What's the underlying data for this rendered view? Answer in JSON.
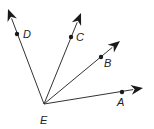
{
  "diagram": {
    "type": "rays-from-common-endpoint",
    "vertex": {
      "label": "E",
      "x": 44,
      "y": 104,
      "label_x": 40,
      "label_y": 124
    },
    "rays": [
      {
        "name": "ray-ED",
        "point_label": "D",
        "tip": [
          8,
          9
        ],
        "point": [
          17,
          34
        ],
        "label_pos": [
          23,
          38
        ]
      },
      {
        "name": "ray-EC",
        "point_label": "C",
        "tip": [
          81,
          13
        ],
        "point": [
          71,
          37
        ],
        "label_pos": [
          76,
          41
        ]
      },
      {
        "name": "ray-EB",
        "point_label": "B",
        "tip": [
          120,
          41
        ],
        "point": [
          101,
          57
        ],
        "label_pos": [
          104,
          67
        ]
      },
      {
        "name": "ray-EA",
        "point_label": "A",
        "tip": [
          143,
          88
        ],
        "point": [
          122,
          92
        ],
        "label_pos": [
          117,
          106
        ]
      }
    ],
    "colors": {
      "line": "#333333",
      "fill": "#1a1a1a",
      "background": "#ffffff"
    }
  }
}
